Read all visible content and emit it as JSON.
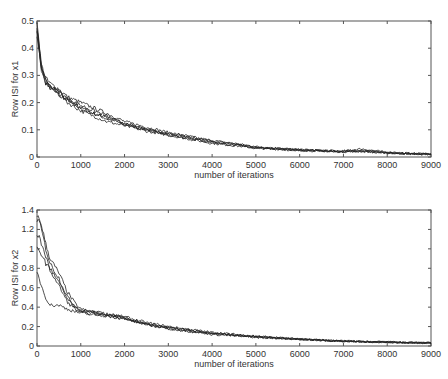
{
  "chart_data": [
    {
      "type": "line",
      "title": "",
      "xlabel": "number of iterations",
      "ylabel": "Row ISI for x1",
      "xlim": [
        0,
        9000
      ],
      "ylim": [
        0,
        0.5
      ],
      "xticks": [
        0,
        1000,
        2000,
        3000,
        4000,
        5000,
        6000,
        7000,
        8000,
        9000
      ],
      "yticks": [
        0,
        0.1,
        0.2,
        0.3,
        0.4,
        0.5
      ],
      "ytick_labels": [
        "0",
        "0.1",
        "0.2",
        "0.3",
        "0.4",
        "0.5"
      ],
      "grid": false,
      "legend": null,
      "x": [
        0,
        50,
        100,
        200,
        300,
        500,
        700,
        1000,
        1300,
        1600,
        2000,
        2500,
        3000,
        3500,
        4000,
        4500,
        5000,
        6000,
        7000,
        7400,
        8000,
        8500,
        9000
      ],
      "series": [
        {
          "name": "run 1",
          "values": [
            0.47,
            0.4,
            0.33,
            0.28,
            0.26,
            0.24,
            0.21,
            0.18,
            0.16,
            0.14,
            0.12,
            0.1,
            0.085,
            0.07,
            0.055,
            0.045,
            0.035,
            0.025,
            0.02,
            0.02,
            0.015,
            0.012,
            0.01
          ]
        },
        {
          "name": "run 2",
          "values": [
            0.48,
            0.41,
            0.34,
            0.29,
            0.27,
            0.25,
            0.22,
            0.2,
            0.18,
            0.16,
            0.13,
            0.11,
            0.09,
            0.075,
            0.06,
            0.05,
            0.038,
            0.027,
            0.022,
            0.03,
            0.017,
            0.014,
            0.012
          ]
        },
        {
          "name": "run 3",
          "values": [
            0.46,
            0.39,
            0.32,
            0.27,
            0.26,
            0.23,
            0.2,
            0.17,
            0.15,
            0.13,
            0.115,
            0.095,
            0.08,
            0.065,
            0.05,
            0.042,
            0.032,
            0.024,
            0.019,
            0.02,
            0.014,
            0.011,
            0.009
          ]
        },
        {
          "name": "run 4",
          "values": [
            0.49,
            0.42,
            0.33,
            0.28,
            0.25,
            0.23,
            0.21,
            0.18,
            0.16,
            0.145,
            0.125,
            0.1,
            0.088,
            0.072,
            0.058,
            0.05,
            0.036,
            0.026,
            0.021,
            0.025,
            0.016,
            0.013,
            0.011
          ]
        },
        {
          "name": "run 5",
          "values": [
            0.45,
            0.38,
            0.32,
            0.27,
            0.26,
            0.24,
            0.21,
            0.19,
            0.17,
            0.15,
            0.12,
            0.1,
            0.082,
            0.068,
            0.054,
            0.044,
            0.034,
            0.025,
            0.02,
            0.022,
            0.015,
            0.012,
            0.01
          ]
        }
      ]
    },
    {
      "type": "line",
      "title": "",
      "xlabel": "number of iterations",
      "ylabel": "Row ISI for x2",
      "xlim": [
        0,
        9000
      ],
      "ylim": [
        0,
        1.4
      ],
      "xticks": [
        0,
        1000,
        2000,
        3000,
        4000,
        5000,
        6000,
        7000,
        8000,
        9000
      ],
      "yticks": [
        0,
        0.2,
        0.4,
        0.6,
        0.8,
        1.0,
        1.2,
        1.4
      ],
      "ytick_labels": [
        "0",
        "0.2",
        "0.4",
        "0.6",
        "0.8",
        "1",
        "1.2",
        "1.4"
      ],
      "grid": false,
      "legend": null,
      "x": [
        0,
        50,
        100,
        200,
        300,
        500,
        700,
        900,
        1000,
        1300,
        1600,
        2000,
        2500,
        3000,
        3500,
        4000,
        5000,
        6000,
        7000,
        8000,
        9000
      ],
      "series": [
        {
          "name": "run 1",
          "values": [
            1.35,
            1.3,
            1.25,
            1.05,
            0.9,
            0.75,
            0.55,
            0.42,
            0.38,
            0.35,
            0.33,
            0.3,
            0.24,
            0.2,
            0.17,
            0.14,
            0.1,
            0.07,
            0.05,
            0.04,
            0.03
          ]
        },
        {
          "name": "run 2",
          "values": [
            1.3,
            1.28,
            1.2,
            1.0,
            0.85,
            0.7,
            0.5,
            0.4,
            0.37,
            0.35,
            0.33,
            0.29,
            0.23,
            0.19,
            0.16,
            0.13,
            0.1,
            0.07,
            0.05,
            0.04,
            0.03
          ]
        },
        {
          "name": "run 3",
          "values": [
            1.15,
            1.12,
            1.05,
            0.92,
            0.8,
            0.65,
            0.48,
            0.38,
            0.36,
            0.34,
            0.32,
            0.29,
            0.22,
            0.19,
            0.16,
            0.13,
            0.1,
            0.07,
            0.05,
            0.04,
            0.03
          ]
        },
        {
          "name": "run 4",
          "values": [
            1.0,
            0.97,
            0.95,
            0.85,
            0.78,
            0.62,
            0.45,
            0.37,
            0.35,
            0.33,
            0.31,
            0.28,
            0.22,
            0.18,
            0.15,
            0.13,
            0.09,
            0.07,
            0.05,
            0.04,
            0.03
          ]
        },
        {
          "name": "run 5",
          "values": [
            0.75,
            0.7,
            0.62,
            0.5,
            0.42,
            0.42,
            0.38,
            0.35,
            0.34,
            0.32,
            0.31,
            0.28,
            0.22,
            0.18,
            0.15,
            0.12,
            0.09,
            0.07,
            0.05,
            0.04,
            0.03
          ]
        }
      ]
    }
  ]
}
